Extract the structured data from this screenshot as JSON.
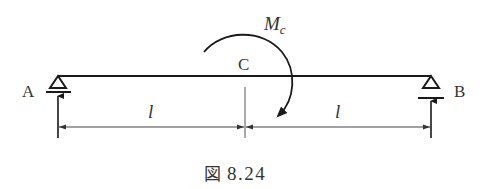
{
  "diagram": {
    "type": "simply-supported-beam",
    "colors": {
      "line": "#1a1a1a",
      "text": "#333333",
      "dim": "#444444",
      "background": "#ffffff"
    },
    "labels": {
      "support_left": "A",
      "support_right": "B",
      "point_c": "C",
      "moment_main": "M",
      "moment_sub": "c",
      "span_left": "l",
      "span_right": "l"
    },
    "caption": {
      "prefix": "図",
      "number": "8.24"
    },
    "elements": {
      "beam": "horizontal beam A–B",
      "support_a": "pin support at A with upward reaction arrow",
      "support_b": "roller support at B with upward reaction arrow",
      "moment": "clockwise concentrated moment M_c applied at C",
      "dimensions": [
        "A–C = l",
        "C–B = l"
      ]
    }
  }
}
